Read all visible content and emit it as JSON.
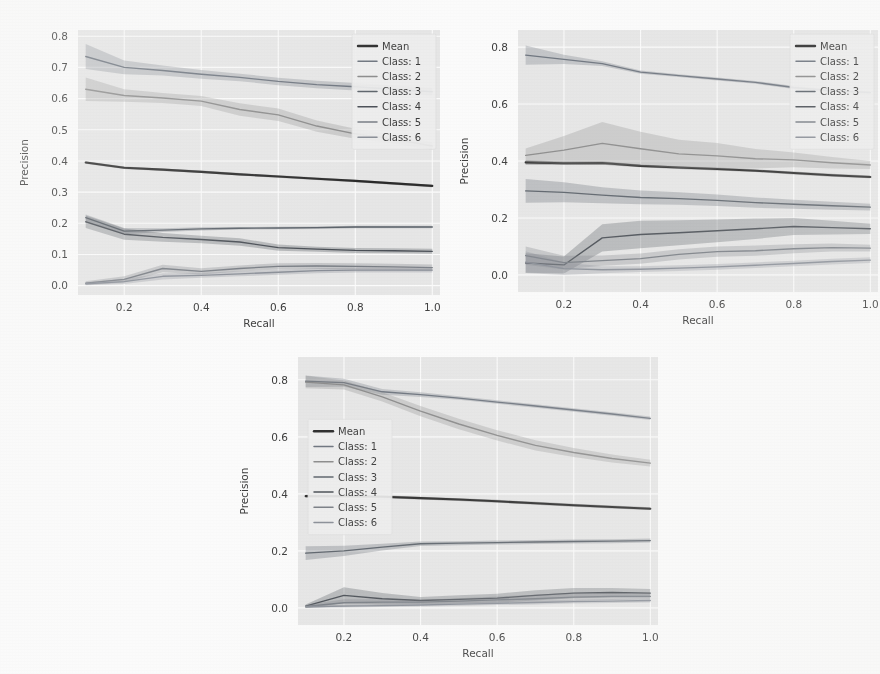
{
  "figure": {
    "background_color": "#ffffff",
    "panel_background_color": "#eaeaea",
    "grid_color": "#ffffff",
    "tick_color": "#3b3b3b"
  },
  "legend": {
    "entries": [
      "Mean",
      "Class: 1",
      "Class: 2",
      "Class: 3",
      "Class: 4",
      "Class: 5",
      "Class: 6"
    ],
    "mean_label": "Mean",
    "position_panel_1": "upper right",
    "position_panel_2": "upper right",
    "position_panel_3": "center left"
  },
  "colors": {
    "mean": "#2b2b2b",
    "class1": "#6f7680",
    "class2": "#8d8d8d",
    "class3": "#5d646c",
    "class4": "#4a4f56",
    "class5": "#7a7f86",
    "class6": "#8b9099",
    "band_opacity": "0.30"
  },
  "chart_data": [
    {
      "type": "line",
      "panel": "top-left",
      "title": "",
      "xlabel": "Recall",
      "ylabel": "Precision",
      "xlim": [
        0.08,
        1.02
      ],
      "ylim": [
        -0.03,
        0.82
      ],
      "xticks": [
        0.2,
        0.4,
        0.6,
        0.8,
        1.0
      ],
      "xticklabels": [
        "0.2",
        "0.4",
        "0.6",
        "0.8",
        "1.0"
      ],
      "yticks": [
        0.0,
        0.1,
        0.2,
        0.3,
        0.4,
        0.5,
        0.6,
        0.7,
        0.8
      ],
      "yticklabels": [
        "0.0",
        "0.1",
        "0.2",
        "0.3",
        "0.4",
        "0.5",
        "0.6",
        "0.7",
        "0.8"
      ],
      "grid": true,
      "legend": "upper right",
      "x": [
        0.1,
        0.2,
        0.3,
        0.4,
        0.5,
        0.6,
        0.7,
        0.8,
        0.9,
        1.0
      ],
      "series": [
        {
          "name": "Mean",
          "values": [
            0.395,
            0.378,
            0.372,
            0.365,
            0.357,
            0.35,
            0.343,
            0.336,
            0.328,
            0.32
          ],
          "band": [
            0.004,
            0.004,
            0.004,
            0.004,
            0.004,
            0.004,
            0.004,
            0.004,
            0.004,
            0.004
          ]
        },
        {
          "name": "Class: 1",
          "values": [
            0.735,
            0.7,
            0.69,
            0.678,
            0.668,
            0.655,
            0.645,
            0.638,
            0.63,
            0.622
          ],
          "band": [
            0.04,
            0.022,
            0.016,
            0.014,
            0.012,
            0.012,
            0.012,
            0.012,
            0.012,
            0.012
          ]
        },
        {
          "name": "Class: 2",
          "values": [
            0.63,
            0.61,
            0.602,
            0.592,
            0.565,
            0.548,
            0.512,
            0.487,
            0.47,
            0.448
          ],
          "band": [
            0.038,
            0.02,
            0.016,
            0.016,
            0.02,
            0.02,
            0.018,
            0.016,
            0.014,
            0.012
          ]
        },
        {
          "name": "Class: 3",
          "values": [
            0.218,
            0.175,
            0.178,
            0.182,
            0.184,
            0.185,
            0.186,
            0.188,
            0.188,
            0.188
          ],
          "band": [
            0.01,
            0.01,
            0.006,
            0.005,
            0.004,
            0.004,
            0.004,
            0.004,
            0.004,
            0.004
          ]
        },
        {
          "name": "Class: 4",
          "values": [
            0.205,
            0.165,
            0.155,
            0.148,
            0.14,
            0.122,
            0.117,
            0.113,
            0.112,
            0.11
          ],
          "band": [
            0.02,
            0.018,
            0.014,
            0.012,
            0.012,
            0.01,
            0.008,
            0.008,
            0.008,
            0.008
          ]
        },
        {
          "name": "Class: 5",
          "values": [
            0.008,
            0.02,
            0.055,
            0.046,
            0.055,
            0.062,
            0.063,
            0.062,
            0.06,
            0.058
          ],
          "band": [
            0.006,
            0.01,
            0.012,
            0.01,
            0.01,
            0.01,
            0.01,
            0.01,
            0.01,
            0.01
          ]
        },
        {
          "name": "Class: 6",
          "values": [
            0.006,
            0.013,
            0.03,
            0.033,
            0.038,
            0.043,
            0.048,
            0.05,
            0.05,
            0.05
          ],
          "band": [
            0.005,
            0.008,
            0.01,
            0.008,
            0.008,
            0.008,
            0.008,
            0.008,
            0.008,
            0.008
          ]
        }
      ]
    },
    {
      "type": "line",
      "panel": "top-right",
      "title": "",
      "xlabel": "Recall",
      "ylabel": "Precision",
      "xlim": [
        0.08,
        1.02
      ],
      "ylim": [
        -0.06,
        0.86
      ],
      "xticks": [
        0.2,
        0.4,
        0.6,
        0.8,
        1.0
      ],
      "xticklabels": [
        "0.2",
        "0.4",
        "0.6",
        "0.8",
        "1.0"
      ],
      "yticks": [
        0.0,
        0.2,
        0.4,
        0.6,
        0.8
      ],
      "yticklabels": [
        "0.0",
        "0.2",
        "0.4",
        "0.6",
        "0.8"
      ],
      "grid": true,
      "legend": "upper right",
      "x": [
        0.1,
        0.2,
        0.3,
        0.4,
        0.5,
        0.6,
        0.7,
        0.8,
        0.9,
        1.0
      ],
      "series": [
        {
          "name": "Mean",
          "values": [
            0.395,
            0.392,
            0.393,
            0.383,
            0.377,
            0.372,
            0.366,
            0.358,
            0.35,
            0.344
          ],
          "band": [
            0.008,
            0.006,
            0.006,
            0.005,
            0.005,
            0.005,
            0.005,
            0.005,
            0.005,
            0.005
          ]
        },
        {
          "name": "Class: 1",
          "values": [
            0.772,
            0.757,
            0.742,
            0.712,
            0.7,
            0.688,
            0.676,
            0.658,
            0.646,
            0.64
          ],
          "band": [
            0.034,
            0.016,
            0.008,
            0.006,
            0.005,
            0.005,
            0.005,
            0.005,
            0.005,
            0.005
          ]
        },
        {
          "name": "Class: 2",
          "values": [
            0.42,
            0.438,
            0.462,
            0.443,
            0.425,
            0.418,
            0.408,
            0.404,
            0.394,
            0.386
          ],
          "band": [
            0.024,
            0.05,
            0.075,
            0.06,
            0.05,
            0.045,
            0.034,
            0.026,
            0.02,
            0.014
          ]
        },
        {
          "name": "Class: 3",
          "values": [
            0.295,
            0.29,
            0.28,
            0.272,
            0.268,
            0.262,
            0.254,
            0.248,
            0.243,
            0.238
          ],
          "band": [
            0.042,
            0.035,
            0.028,
            0.024,
            0.022,
            0.02,
            0.018,
            0.016,
            0.014,
            0.012
          ]
        },
        {
          "name": "Class: 4",
          "values": [
            0.042,
            0.035,
            0.13,
            0.142,
            0.148,
            0.155,
            0.162,
            0.17,
            0.166,
            0.162
          ],
          "band": [
            0.034,
            0.03,
            0.048,
            0.048,
            0.044,
            0.04,
            0.036,
            0.03,
            0.024,
            0.018
          ]
        },
        {
          "name": "Class: 5",
          "values": [
            0.068,
            0.043,
            0.05,
            0.057,
            0.072,
            0.082,
            0.085,
            0.092,
            0.096,
            0.094
          ],
          "band": [
            0.032,
            0.024,
            0.018,
            0.018,
            0.018,
            0.018,
            0.018,
            0.016,
            0.014,
            0.012
          ]
        },
        {
          "name": "Class: 6",
          "values": [
            0.045,
            0.022,
            0.018,
            0.02,
            0.024,
            0.028,
            0.034,
            0.04,
            0.047,
            0.052
          ],
          "band": [
            0.038,
            0.022,
            0.012,
            0.01,
            0.01,
            0.01,
            0.01,
            0.01,
            0.01,
            0.01
          ]
        }
      ]
    },
    {
      "type": "line",
      "panel": "bottom-center",
      "title": "",
      "xlabel": "Recall",
      "ylabel": "Precision",
      "xlim": [
        0.08,
        1.02
      ],
      "ylim": [
        -0.06,
        0.88
      ],
      "xticks": [
        0.2,
        0.4,
        0.6,
        0.8,
        1.0
      ],
      "xticklabels": [
        "0.2",
        "0.4",
        "0.6",
        "0.8",
        "1.0"
      ],
      "yticks": [
        0.0,
        0.2,
        0.4,
        0.6,
        0.8
      ],
      "yticklabels": [
        "0.0",
        "0.2",
        "0.4",
        "0.6",
        "0.8"
      ],
      "grid": true,
      "legend": "center left",
      "x": [
        0.1,
        0.2,
        0.3,
        0.4,
        0.5,
        0.6,
        0.7,
        0.8,
        0.9,
        1.0
      ],
      "series": [
        {
          "name": "Mean",
          "values": [
            0.392,
            0.392,
            0.39,
            0.385,
            0.38,
            0.374,
            0.367,
            0.36,
            0.354,
            0.348
          ],
          "band": [
            0.005,
            0.005,
            0.005,
            0.005,
            0.005,
            0.005,
            0.005,
            0.005,
            0.005,
            0.005
          ]
        },
        {
          "name": "Class: 1",
          "values": [
            0.795,
            0.79,
            0.758,
            0.748,
            0.736,
            0.722,
            0.708,
            0.694,
            0.68,
            0.665
          ],
          "band": [
            0.02,
            0.014,
            0.01,
            0.008,
            0.006,
            0.006,
            0.006,
            0.006,
            0.006,
            0.006
          ]
        },
        {
          "name": "Class: 2",
          "values": [
            0.792,
            0.782,
            0.74,
            0.69,
            0.645,
            0.605,
            0.57,
            0.545,
            0.524,
            0.508
          ],
          "band": [
            0.022,
            0.016,
            0.016,
            0.018,
            0.018,
            0.018,
            0.018,
            0.016,
            0.014,
            0.012
          ]
        },
        {
          "name": "Class: 3",
          "values": [
            0.192,
            0.2,
            0.213,
            0.225,
            0.227,
            0.229,
            0.231,
            0.233,
            0.234,
            0.236
          ],
          "band": [
            0.024,
            0.018,
            0.012,
            0.008,
            0.007,
            0.007,
            0.007,
            0.007,
            0.007,
            0.007
          ]
        },
        {
          "name": "Class: 4",
          "values": [
            0.006,
            0.044,
            0.032,
            0.026,
            0.03,
            0.034,
            0.044,
            0.052,
            0.054,
            0.052
          ],
          "band": [
            0.006,
            0.028,
            0.02,
            0.012,
            0.014,
            0.016,
            0.018,
            0.018,
            0.016,
            0.014
          ]
        },
        {
          "name": "Class: 5",
          "values": [
            0.005,
            0.018,
            0.02,
            0.02,
            0.024,
            0.028,
            0.032,
            0.038,
            0.04,
            0.04
          ],
          "band": [
            0.005,
            0.012,
            0.01,
            0.008,
            0.01,
            0.012,
            0.014,
            0.014,
            0.012,
            0.01
          ]
        },
        {
          "name": "Class: 6",
          "values": [
            0.004,
            0.006,
            0.008,
            0.01,
            0.013,
            0.016,
            0.019,
            0.022,
            0.024,
            0.026
          ],
          "band": [
            0.004,
            0.005,
            0.005,
            0.005,
            0.006,
            0.006,
            0.007,
            0.007,
            0.007,
            0.007
          ]
        }
      ]
    }
  ]
}
